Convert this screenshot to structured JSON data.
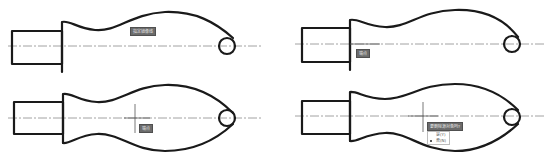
{
  "figure": {
    "panels": [
      {
        "id": "top-left",
        "step": 1,
        "state": "original upper profile, mirror command prompt",
        "tooltip": "指定镜像线"
      },
      {
        "id": "top-right",
        "step": 2,
        "state": "picking first point of mirror line",
        "tooltip": "端点"
      },
      {
        "id": "bottom-left",
        "step": 3,
        "state": "picking second point, preview of mirrored curve",
        "tooltip": "端点"
      },
      {
        "id": "bottom-right",
        "step": 4,
        "state": "prompt to erase source objects",
        "tooltip": "要删除源对象吗?",
        "menu": [
          {
            "label": "是(Y)",
            "selected": false
          },
          {
            "label": "否(N)",
            "selected": true
          }
        ]
      }
    ],
    "colors": {
      "outline": "#1a1a1a",
      "centerline": "#8a8a8a",
      "tooltip_bg": "#6b6b6b"
    }
  }
}
